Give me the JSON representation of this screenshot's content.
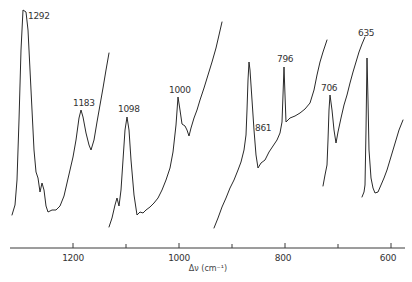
{
  "chart_data": {
    "type": "line",
    "title": "",
    "xlabel": "Δν (cm⁻¹)",
    "ylabel": "",
    "xlim": [
      1320,
      565
    ],
    "x_reversed": true,
    "grid": false,
    "legend": null,
    "x_ticks": [
      {
        "value": 1200,
        "label": "1200",
        "major": true
      },
      {
        "value": 1100,
        "label": "",
        "major": false
      },
      {
        "value": 1000,
        "label": "1000",
        "major": true
      },
      {
        "value": 900,
        "label": "",
        "major": false
      },
      {
        "value": 800,
        "label": "800",
        "major": true
      },
      {
        "value": 700,
        "label": "",
        "major": false
      },
      {
        "value": 600,
        "label": "600",
        "major": true
      }
    ],
    "peaks": [
      {
        "label": "1292",
        "wavenumber": 1292
      },
      {
        "label": "1183",
        "wavenumber": 1183
      },
      {
        "label": "1098",
        "wavenumber": 1098
      },
      {
        "label": "1000",
        "wavenumber": 1000
      },
      {
        "label": "861",
        "wavenumber": 861
      },
      {
        "label": "796",
        "wavenumber": 796
      },
      {
        "label": "706",
        "wavenumber": 706
      },
      {
        "label": "635",
        "wavenumber": 635
      }
    ],
    "series": [
      {
        "name": "segment-1",
        "description": "Raman trace 1320–1130 cm⁻¹ (peaks 1292, 1183)",
        "points": [
          [
            12,
            215
          ],
          [
            15,
            205
          ],
          [
            17,
            180
          ],
          [
            19,
            120
          ],
          [
            21,
            50
          ],
          [
            23,
            10
          ],
          [
            26,
            12
          ],
          [
            28,
            30
          ],
          [
            31,
            90
          ],
          [
            34,
            150
          ],
          [
            36,
            172
          ],
          [
            38,
            178
          ],
          [
            40,
            192
          ],
          [
            42,
            183
          ],
          [
            44,
            190
          ],
          [
            46,
            206
          ],
          [
            48,
            212
          ],
          [
            52,
            210
          ],
          [
            56,
            210
          ],
          [
            60,
            206
          ],
          [
            64,
            196
          ],
          [
            67,
            183
          ],
          [
            70,
            170
          ],
          [
            73,
            157
          ],
          [
            76,
            140
          ],
          [
            79,
            118
          ],
          [
            81,
            110
          ],
          [
            83,
            117
          ],
          [
            86,
            133
          ],
          [
            89,
            145
          ],
          [
            91,
            150
          ],
          [
            94,
            140
          ],
          [
            97,
            122
          ],
          [
            100,
            105
          ],
          [
            103,
            88
          ],
          [
            106,
            70
          ],
          [
            109,
            53
          ]
        ]
      },
      {
        "name": "segment-2",
        "description": "Raman trace 1120–960 cm⁻¹ (peaks 1098, 1000)",
        "points": [
          [
            109,
            227
          ],
          [
            112,
            218
          ],
          [
            115,
            205
          ],
          [
            117,
            198
          ],
          [
            119,
            206
          ],
          [
            121,
            190
          ],
          [
            123,
            160
          ],
          [
            125,
            130
          ],
          [
            127,
            117
          ],
          [
            129,
            130
          ],
          [
            131,
            160
          ],
          [
            134,
            195
          ],
          [
            137,
            215
          ],
          [
            140,
            212
          ],
          [
            143,
            213
          ],
          [
            146,
            210
          ],
          [
            150,
            207
          ],
          [
            154,
            203
          ],
          [
            158,
            198
          ],
          [
            162,
            190
          ],
          [
            166,
            180
          ],
          [
            170,
            168
          ],
          [
            173,
            152
          ],
          [
            176,
            125
          ],
          [
            178,
            97
          ],
          [
            180,
            110
          ],
          [
            182,
            124
          ],
          [
            185,
            126
          ],
          [
            187,
            130
          ],
          [
            189,
            136
          ],
          [
            191,
            128
          ],
          [
            194,
            118
          ],
          [
            197,
            110
          ],
          [
            200,
            100
          ],
          [
            204,
            88
          ],
          [
            208,
            75
          ],
          [
            212,
            62
          ],
          [
            216,
            48
          ],
          [
            219,
            35
          ],
          [
            222,
            22
          ]
        ]
      },
      {
        "name": "segment-3",
        "description": "Raman trace 925–745 cm⁻¹ (peaks 861, 796)",
        "points": [
          [
            214,
            228
          ],
          [
            218,
            218
          ],
          [
            222,
            207
          ],
          [
            226,
            198
          ],
          [
            230,
            188
          ],
          [
            234,
            180
          ],
          [
            238,
            170
          ],
          [
            241,
            162
          ],
          [
            244,
            150
          ],
          [
            246,
            135
          ],
          [
            247,
            110
          ],
          [
            248,
            80
          ],
          [
            249,
            62
          ],
          [
            250,
            70
          ],
          [
            252,
            100
          ],
          [
            254,
            130
          ],
          [
            256,
            155
          ],
          [
            258,
            168
          ],
          [
            261,
            163
          ],
          [
            265,
            160
          ],
          [
            269,
            152
          ],
          [
            273,
            146
          ],
          [
            277,
            140
          ],
          [
            280,
            133
          ],
          [
            282,
            122
          ],
          [
            283,
            95
          ],
          [
            284,
            67
          ],
          [
            285,
            95
          ],
          [
            286,
            122
          ],
          [
            290,
            118
          ],
          [
            295,
            116
          ],
          [
            300,
            113
          ],
          [
            305,
            109
          ],
          [
            310,
            103
          ],
          [
            314,
            90
          ],
          [
            317,
            75
          ],
          [
            320,
            62
          ],
          [
            323,
            52
          ],
          [
            327,
            40
          ]
        ]
      },
      {
        "name": "segment-4",
        "description": "Raman trace 720–655 cm⁻¹ (peak 706)",
        "points": [
          [
            323,
            186
          ],
          [
            325,
            175
          ],
          [
            327,
            165
          ],
          [
            328,
            140
          ],
          [
            329,
            110
          ],
          [
            330,
            95
          ],
          [
            332,
            110
          ],
          [
            334,
            130
          ],
          [
            336,
            143
          ],
          [
            338,
            132
          ],
          [
            341,
            118
          ],
          [
            344,
            105
          ],
          [
            347,
            95
          ],
          [
            350,
            83
          ],
          [
            353,
            72
          ],
          [
            356,
            62
          ],
          [
            359,
            52
          ],
          [
            362,
            44
          ],
          [
            365,
            37
          ]
        ]
      },
      {
        "name": "segment-5",
        "description": "Raman trace 650–570 cm⁻¹ (peak 635)",
        "points": [
          [
            362,
            197
          ],
          [
            364,
            192
          ],
          [
            365,
            185
          ],
          [
            366,
            130
          ],
          [
            367,
            58
          ],
          [
            368,
            100
          ],
          [
            369,
            150
          ],
          [
            371,
            178
          ],
          [
            373,
            188
          ],
          [
            375,
            193
          ],
          [
            378,
            192
          ],
          [
            381,
            185
          ],
          [
            384,
            178
          ],
          [
            387,
            170
          ],
          [
            390,
            160
          ],
          [
            393,
            150
          ],
          [
            396,
            140
          ],
          [
            399,
            130
          ],
          [
            403,
            120
          ]
        ]
      }
    ],
    "peak_label_positions": [
      {
        "label": "1292",
        "x": 28,
        "y": 19
      },
      {
        "label": "1183",
        "x": 73,
        "y": 106
      },
      {
        "label": "1098",
        "x": 118,
        "y": 112
      },
      {
        "label": "1000",
        "x": 169,
        "y": 93
      },
      {
        "label": "861",
        "x": 255,
        "y": 131
      },
      {
        "label": "796",
        "x": 277,
        "y": 62
      },
      {
        "label": "706",
        "x": 321,
        "y": 91
      },
      {
        "label": "635",
        "x": 358,
        "y": 36
      }
    ]
  },
  "axis": {
    "title": "Δν (cm⁻¹)",
    "y_px": 248,
    "x_start_px": 10,
    "x_end_px": 405,
    "px_per_cm": 0.53,
    "ref_value": 1200,
    "ref_px": 73,
    "tick_labels": {
      "t1200": "1200",
      "t1000": "1000",
      "t800": "800",
      "t600": "600"
    }
  },
  "colors": {
    "trace": "#2a2a2a",
    "axis": "#3a3a3a",
    "text": "#333333",
    "background": "#ffffff"
  }
}
